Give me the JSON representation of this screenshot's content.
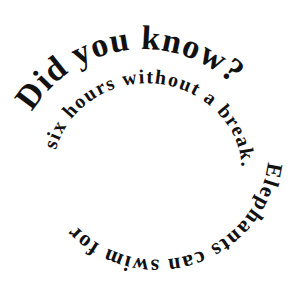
{
  "spiral": {
    "headline": "Did you know?",
    "fact_part1": "Elephants can swim for",
    "fact_part2": "six hours without a break."
  },
  "colors": {
    "text": "#111111",
    "background": "#ffffff"
  }
}
